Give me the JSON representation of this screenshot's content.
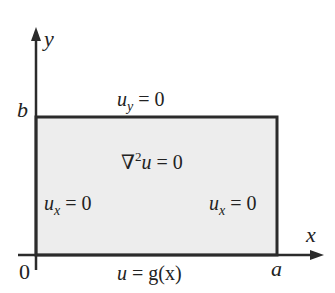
{
  "diagram": {
    "axes": {
      "x_label": "x",
      "y_label": "y"
    },
    "corners": {
      "origin": "0",
      "a": "a",
      "b": "b"
    },
    "boundary_conditions": {
      "top": {
        "u": "u",
        "sub": "y",
        "rhs": " = 0"
      },
      "left": {
        "u": "u",
        "sub": "x",
        "rhs": " = 0"
      },
      "right": {
        "u": "u",
        "sub": "x",
        "rhs": " = 0"
      },
      "bottom": {
        "lhs": "u",
        "rhs": " = g(x)"
      }
    },
    "pde": {
      "op": "∇",
      "sup": "2",
      "var": "u",
      "rhs": " = 0"
    },
    "colors": {
      "fill": "#ededed",
      "stroke": "#2b2b2b"
    }
  }
}
